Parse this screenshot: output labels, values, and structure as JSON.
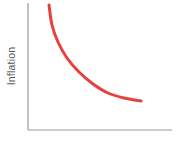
{
  "chart_data": {
    "type": "line",
    "title": "",
    "xlabel": "",
    "ylabel": "Inflation",
    "grid": false,
    "legend": null,
    "series": [
      {
        "name": "curve",
        "color": "#e8403a",
        "shape": "convex decreasing curve (Phillips-curve style)",
        "points_px": [
          [
            49,
            5
          ],
          [
            52,
            25
          ],
          [
            58,
            42
          ],
          [
            67,
            58
          ],
          [
            79,
            72
          ],
          [
            93,
            84
          ],
          [
            108,
            93
          ],
          [
            124,
            98
          ],
          [
            141,
            101
          ]
        ]
      }
    ],
    "axes": {
      "color": "#9a9a9a",
      "x_axis": {
        "from": [
          28,
          130
        ],
        "to": [
          172,
          130
        ]
      },
      "y_axis": {
        "from": [
          28,
          3
        ],
        "to": [
          28,
          130
        ]
      }
    }
  }
}
